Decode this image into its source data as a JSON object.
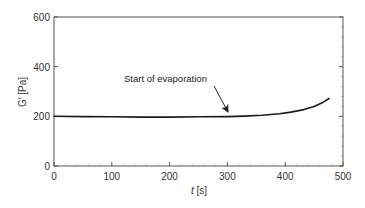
{
  "chart_data": {
    "type": "line",
    "title": "",
    "xlabel": "t [s]",
    "xlabel_italic_part": "t",
    "xlabel_unit": "[s]",
    "ylabel": "G′ [Pa]",
    "xlim": [
      0,
      500
    ],
    "ylim": [
      0,
      600
    ],
    "xticks": [
      0,
      100,
      200,
      300,
      400,
      500
    ],
    "yticks": [
      0,
      200,
      400,
      600
    ],
    "grid": false,
    "legend": null,
    "series": [
      {
        "name": "G′",
        "color": "#1a1a1a",
        "x": [
          0,
          50,
          100,
          150,
          200,
          250,
          300,
          330,
          360,
          390,
          410,
          430,
          450,
          465,
          476
        ],
        "y": [
          200,
          199,
          198,
          197,
          197,
          198,
          199,
          201,
          204,
          210,
          217,
          226,
          240,
          256,
          272
        ]
      }
    ],
    "annotations": [
      {
        "text": "Start of evaporation",
        "arrow_to": {
          "x": 310,
          "y": 200
        }
      }
    ]
  },
  "labels": {
    "x_unit": " [s]",
    "x_var": "t",
    "y": "G′ [Pa]",
    "annotation": "Start of evaporation",
    "xticks": [
      "0",
      "100",
      "200",
      "300",
      "400",
      "500"
    ],
    "yticks": [
      "0",
      "200",
      "400",
      "600"
    ]
  }
}
